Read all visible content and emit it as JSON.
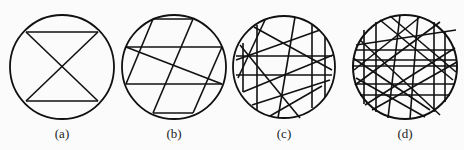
{
  "panels": [
    {
      "label": "(a)",
      "cx": 62,
      "cy": 67,
      "r": 52
    },
    {
      "label": "(b)",
      "cx": 174,
      "cy": 67,
      "r": 52
    },
    {
      "label": "(c)",
      "cx": 284,
      "cy": 67,
      "r": 51
    },
    {
      "label": "(d)",
      "cx": 405,
      "cy": 67,
      "r": 52
    }
  ],
  "colors": {
    "stroke": "#111111",
    "background": "#fbfbfb"
  }
}
